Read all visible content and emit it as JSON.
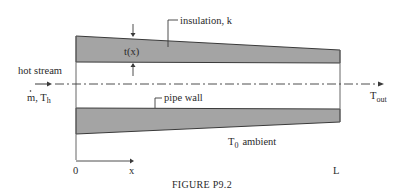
{
  "diagram": {
    "type": "tapered insulated pipe cross-section",
    "colors": {
      "insulation_fill": "#a4a4a4",
      "outline": "#3a3a3a",
      "text": "#2a2a2a",
      "background": "#ffffff"
    },
    "labels": {
      "insulation": "insulation, k",
      "thickness": "t(x)",
      "hot_stream": "hot stream",
      "inlet_mass": "m",
      "inlet_sep": ", ",
      "inlet_temp": "T",
      "inlet_temp_sub": "h",
      "outlet_temp": "T",
      "outlet_temp_sub": "out",
      "pipe_wall": "pipe wall",
      "ambient_temp": "T",
      "ambient_temp_sub": "0",
      "ambient_word": "ambient",
      "origin": "0",
      "x_axis": "x",
      "length": "L"
    },
    "caption": "FIGURE P9.2"
  }
}
